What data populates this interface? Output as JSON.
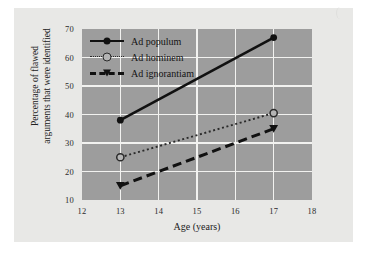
{
  "chart_data": {
    "type": "line",
    "title": "",
    "xlabel": "Age (years)",
    "ylabel": "Percentage of flawed arguments that were identified",
    "ylabel_line1": "Percentage of flawed",
    "ylabel_line2": "arguments that were identified",
    "xlim": [
      12,
      18
    ],
    "ylim": [
      10,
      70
    ],
    "xticks": [
      "12",
      "13",
      "14",
      "15",
      "16",
      "17",
      "18"
    ],
    "yticks": [
      "10",
      "20",
      "30",
      "40",
      "50",
      "60",
      "70"
    ],
    "x": [
      13,
      17
    ],
    "grid": true,
    "legend_position": "top-left-inside",
    "plot_background": "#9d9d9d",
    "gridline_color": "#f2f2f0",
    "series": [
      {
        "name": "Ad populum",
        "values": [
          38,
          67
        ],
        "line_style": "solid",
        "marker": "filled-circle",
        "color": "#111111"
      },
      {
        "name": "Ad hominem",
        "values": [
          25,
          40.5
        ],
        "line_style": "dotted",
        "marker": "open-circle",
        "color": "#2a2a2a"
      },
      {
        "name": "Ad ignorantiam",
        "values": [
          15,
          35
        ],
        "line_style": "dashed",
        "marker": "filled-triangle",
        "color": "#111111"
      }
    ]
  },
  "legend": {
    "items": [
      {
        "label": "Ad populum"
      },
      {
        "label": "Ad hominem"
      },
      {
        "label": "Ad ignorantiam"
      }
    ]
  },
  "axes": {
    "x_title": "Age (years)",
    "y_title_line1": "Percentage of flawed",
    "y_title_line2": "arguments that were identified"
  }
}
